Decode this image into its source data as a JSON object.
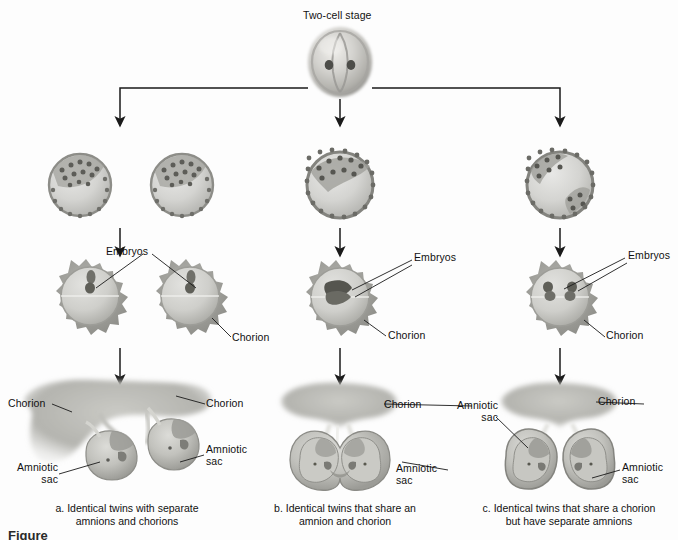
{
  "figure": {
    "top_label": "Two-cell stage",
    "cut_off_title": "Figure",
    "columns": [
      {
        "id": "a",
        "caption": "a. Identical twins with separate\namnions and chorions",
        "blastocyst_count": 2,
        "inner_cell_masses": 1,
        "labels": {
          "embryos": "Embryos",
          "chorion_left": "Chorion",
          "chorion_right": "Chorion",
          "chorion_vesicle": "Chorion",
          "amniotic_sac": "Amniotic\nsac",
          "amniotic_sac_right": "Amniotic\nsac"
        }
      },
      {
        "id": "b",
        "caption": "b. Identical twins that share an\namnion and chorion",
        "blastocyst_count": 1,
        "inner_cell_masses": 1,
        "labels": {
          "embryos": "Embryos",
          "chorion_vesicle": "Chorion",
          "chorion_fetal": "Chorion",
          "amniotic_sac": "Amniotic\nsac"
        }
      },
      {
        "id": "c",
        "caption": "c. Identical twins that share a chorion\nbut have separate amnions",
        "blastocyst_count": 1,
        "inner_cell_masses": 2,
        "labels": {
          "embryos": "Embryos",
          "chorion_vesicle": "Chorion",
          "chorion_fetal": "Chorion",
          "amniotic_sac_left": "Amniotic\nsac",
          "amniotic_sac_right": "Amniotic\nsac"
        }
      }
    ],
    "colors": {
      "background": "#fdfdfd",
      "line": "#1a1a1a",
      "text": "#111111",
      "cell_light": "#d9d9d9",
      "cell_mid": "#b4b4b4",
      "cell_dark": "#8c8c8c",
      "cell_darkest": "#6a6a6a",
      "tissue_light": "#cfcfcf",
      "tissue_mid": "#a8a8a8"
    }
  }
}
